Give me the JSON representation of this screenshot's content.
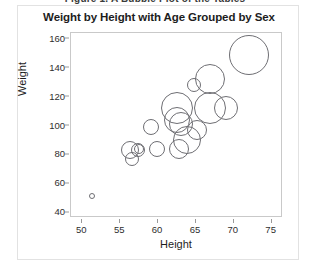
{
  "clipped_caption": "Figure 1. A Bubble Plot of the Tables",
  "figure": {
    "y_axis_title": "Weight",
    "x_axis_title": "Height"
  },
  "chart_data": {
    "type": "scatter",
    "title": "Weight by Height with Age Grouped by Sex",
    "xlabel": "Height",
    "ylabel": "Weight",
    "xlim": [
      48.5,
      76.5
    ],
    "ylim": [
      36,
      164
    ],
    "xticks": [
      50,
      55,
      60,
      65,
      70,
      75
    ],
    "yticks": [
      40,
      60,
      80,
      100,
      120,
      140,
      160
    ],
    "grid": false,
    "legend": null,
    "size_encodes": "Age",
    "marker": "open-circle",
    "marker_color": "#6e6e73",
    "points": [
      {
        "x": 51.3,
        "y": 51,
        "size": 3
      },
      {
        "x": 56.3,
        "y": 83,
        "size": 9
      },
      {
        "x": 56.5,
        "y": 77,
        "size": 7
      },
      {
        "x": 57.3,
        "y": 83,
        "size": 7
      },
      {
        "x": 57.5,
        "y": 84,
        "size": 5
      },
      {
        "x": 59.0,
        "y": 99,
        "size": 8
      },
      {
        "x": 59.8,
        "y": 84,
        "size": 8
      },
      {
        "x": 62.5,
        "y": 112,
        "size": 16
      },
      {
        "x": 62.5,
        "y": 104,
        "size": 13
      },
      {
        "x": 63.0,
        "y": 101,
        "size": 12
      },
      {
        "x": 62.7,
        "y": 84,
        "size": 10
      },
      {
        "x": 63.8,
        "y": 90,
        "size": 14
      },
      {
        "x": 64.8,
        "y": 128,
        "size": 7
      },
      {
        "x": 65.2,
        "y": 97,
        "size": 10
      },
      {
        "x": 66.9,
        "y": 132,
        "size": 15
      },
      {
        "x": 66.8,
        "y": 112,
        "size": 16
      },
      {
        "x": 69.0,
        "y": 112,
        "size": 12
      },
      {
        "x": 72.0,
        "y": 149,
        "size": 20
      }
    ]
  }
}
